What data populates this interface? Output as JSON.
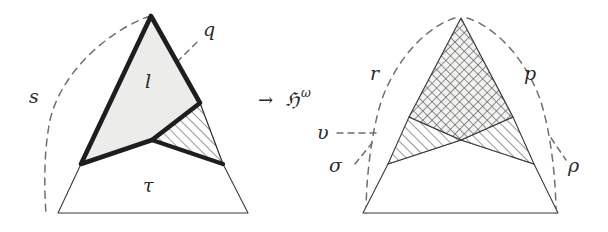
{
  "figure": {
    "background_color": "#ffffff",
    "ink_color": "#2b2b2b",
    "fill_light_gray": "#ececeb",
    "map_arrow": {
      "symbol": "→",
      "label": "ℌ",
      "superscript": "ω"
    },
    "left_panel": {
      "name": "source-complex",
      "labels": {
        "s": "s",
        "q": "q",
        "l": "l",
        "tau": "τ"
      },
      "regions": [
        {
          "name": "upper-triangle",
          "label": "l",
          "fill": "light-gray",
          "stroke": "thick"
        },
        {
          "name": "hatched-wedge",
          "label": "",
          "fill": "diagonal-hatch",
          "stroke": "thick"
        },
        {
          "name": "lower-trapezoid",
          "label": "τ",
          "fill": "white",
          "stroke": "thin"
        }
      ],
      "dashed_curves": [
        "s",
        "q"
      ]
    },
    "right_panel": {
      "name": "target-complex",
      "labels": {
        "r": "r",
        "p": "p",
        "upsilon": "υ",
        "sigma": "σ",
        "rho": "ρ"
      },
      "regions": [
        {
          "name": "upper-triangle",
          "label": "",
          "fill": "cross-hatch",
          "stroke": "thin"
        },
        {
          "name": "left-wing",
          "label": "",
          "fill": "diagonal-hatch",
          "stroke": "thin"
        },
        {
          "name": "right-wing",
          "label": "",
          "fill": "diagonal-hatch",
          "stroke": "thin"
        },
        {
          "name": "lower-trapezoid",
          "label": "",
          "fill": "white",
          "stroke": "thin"
        }
      ],
      "dashed_curves": [
        "r",
        "p",
        "υ",
        "σ",
        "ρ"
      ]
    }
  }
}
